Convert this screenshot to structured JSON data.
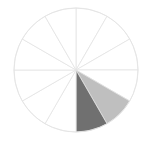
{
  "figure": {
    "background_color": "#ffffff",
    "width": 152,
    "height": 144
  },
  "chart_data": {
    "type": "pie",
    "title": "",
    "subtitle": "",
    "xlabel": "",
    "ylabel": "",
    "legend": "none",
    "grid": false,
    "note": "Radial pie with 12 equal wedges of 30 degrees each; all wedges unfilled white with light gray outlines except two shaded wedges in the lower portion.",
    "center_x": 76,
    "center_y": 70,
    "radius": 62,
    "start_angle_deg": 90,
    "direction": "clockwise",
    "slice_count": 12,
    "categories": [
      "Slice 1",
      "Slice 2",
      "Slice 3",
      "Slice 4",
      "Slice 5",
      "Slice 6",
      "Slice 7",
      "Slice 8",
      "Slice 9",
      "Slice 10",
      "Slice 11",
      "Slice 12"
    ],
    "values": [
      8.3333,
      8.3333,
      8.3333,
      8.3333,
      8.3333,
      8.3333,
      8.3333,
      8.3333,
      8.3333,
      8.3333,
      8.3333,
      8.3333
    ],
    "angles_deg": [
      30,
      30,
      30,
      30,
      30,
      30,
      30,
      30,
      30,
      30,
      30,
      30
    ],
    "slice_colors": [
      "#ffffff",
      "#ffffff",
      "#ffffff",
      "#ffffff",
      "#bfbfbf",
      "#707070",
      "#ffffff",
      "#ffffff",
      "#ffffff",
      "#ffffff",
      "#ffffff",
      "#ffffff"
    ],
    "highlighted_slices": [
      {
        "index": 5,
        "label": "Slice 6",
        "color": "#707070",
        "tone": "dark-gray"
      },
      {
        "index": 4,
        "label": "Slice 5",
        "color": "#bfbfbf",
        "tone": "light-gray"
      }
    ]
  },
  "style": {
    "outline_color": "#e3e3e3",
    "outline_width": 0.8,
    "unfilled_color": "#ffffff",
    "dark_slice_color": "#707070",
    "light_slice_color": "#bfbfbf",
    "background_color": "#ffffff"
  }
}
